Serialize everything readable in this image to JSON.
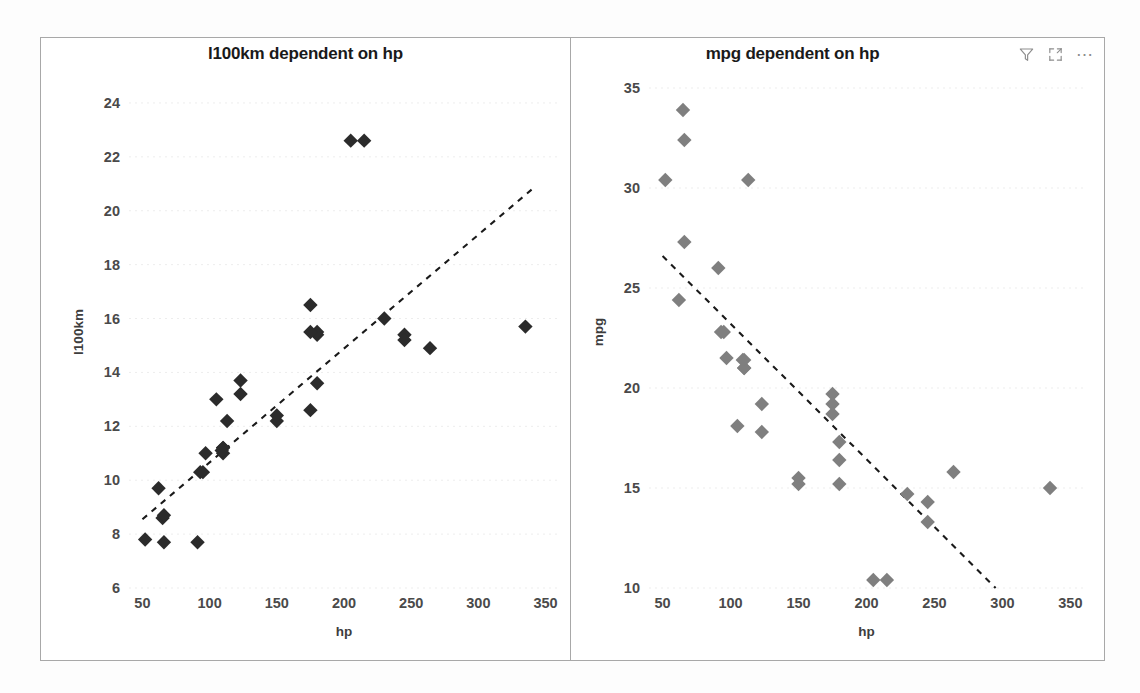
{
  "page": {
    "background": "#fdfdfd",
    "visual_border_color": "#a8a8a8"
  },
  "visuals": [
    {
      "id": "l100km-scatter",
      "title": "l100km dependent on hp",
      "marker_color": "#2b2b2b",
      "trendline_color": "#1a1a1a"
    },
    {
      "id": "mpg-scatter",
      "title": "mpg dependent on hp",
      "marker_color": "#7f7f7f",
      "trendline_color": "#1a1a1a",
      "header_icons": [
        {
          "name": "filter-icon",
          "label": "Filters"
        },
        {
          "name": "focus-mode-icon",
          "label": "Focus mode"
        },
        {
          "name": "more-options-icon",
          "label": "More options"
        }
      ]
    }
  ],
  "chart_data": [
    {
      "type": "scatter",
      "title": "l100km dependent on hp",
      "xlabel": "hp",
      "ylabel": "l100km",
      "xlim": [
        40,
        360
      ],
      "ylim": [
        6,
        25
      ],
      "xticks": [
        50,
        100,
        150,
        200,
        250,
        300,
        350
      ],
      "yticks": [
        6,
        8,
        10,
        12,
        14,
        16,
        18,
        20,
        22,
        24
      ],
      "grid": true,
      "marker": "diamond",
      "marker_color": "#2b2b2b",
      "x": [
        110,
        110,
        93,
        110,
        175,
        105,
        245,
        62,
        95,
        123,
        123,
        180,
        180,
        180,
        205,
        215,
        230,
        66,
        52,
        65,
        97,
        150,
        150,
        245,
        175,
        66,
        91,
        113,
        264,
        175,
        335,
        109
      ],
      "y": [
        11.2,
        11.2,
        10.3,
        11.0,
        12.6,
        13.0,
        15.4,
        9.7,
        10.3,
        13.2,
        13.7,
        15.4,
        13.6,
        15.5,
        22.6,
        22.6,
        16.0,
        7.7,
        7.8,
        8.6,
        11.0,
        12.2,
        12.4,
        15.2,
        15.5,
        8.7,
        7.7,
        12.2,
        14.9,
        16.5,
        15.7,
        11.1
      ],
      "trendline": {
        "type": "linear",
        "x0": 50,
        "y0": 8.55,
        "x1": 340,
        "y1": 20.8,
        "style": "dashed"
      }
    },
    {
      "type": "scatter",
      "title": "mpg dependent on hp",
      "xlabel": "hp",
      "ylabel": "mpg",
      "xlim": [
        40,
        360
      ],
      "ylim": [
        10,
        35.6
      ],
      "xticks": [
        50,
        100,
        150,
        200,
        250,
        300,
        350
      ],
      "yticks": [
        10,
        15,
        20,
        25,
        30,
        35
      ],
      "grid": true,
      "marker": "diamond",
      "marker_color": "#7f7f7f",
      "x": [
        110,
        110,
        93,
        110,
        175,
        105,
        245,
        62,
        95,
        123,
        123,
        180,
        180,
        180,
        205,
        215,
        230,
        66,
        52,
        65,
        97,
        150,
        150,
        245,
        175,
        66,
        91,
        113,
        264,
        175,
        335,
        109
      ],
      "y": [
        21.0,
        21.0,
        22.8,
        21.4,
        18.7,
        18.1,
        14.3,
        24.4,
        22.8,
        19.2,
        17.8,
        16.4,
        17.3,
        15.2,
        10.4,
        10.4,
        14.7,
        32.4,
        30.4,
        33.9,
        21.5,
        15.5,
        15.2,
        13.3,
        19.2,
        27.3,
        26.0,
        30.4,
        15.8,
        19.7,
        15.0,
        21.4
      ],
      "trendline": {
        "type": "linear",
        "x0": 50,
        "y0": 26.6,
        "x1": 295,
        "y1": 10.0,
        "style": "dashed"
      }
    }
  ]
}
